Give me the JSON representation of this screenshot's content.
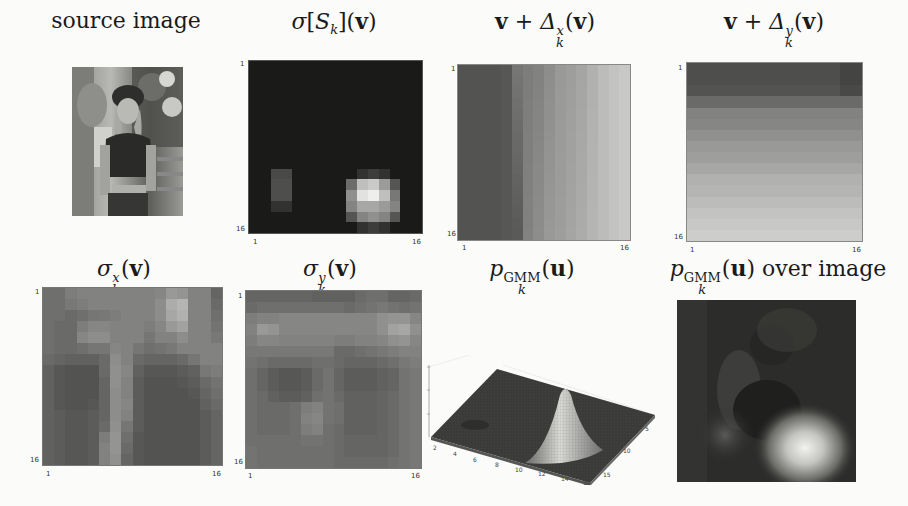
{
  "figure": {
    "panels": [
      {
        "id": "source",
        "title": "source image",
        "type": "image"
      },
      {
        "id": "sigma_S",
        "title_parts": {
          "pre": "σ[S",
          "sub": "k",
          "post": "](",
          "bold": "v",
          "end": ")"
        },
        "type": "heatmap",
        "x_ticks": [
          "1",
          "16"
        ],
        "y_ticks": [
          "1",
          "16"
        ]
      },
      {
        "id": "delta_x",
        "title_parts": {
          "bold1": "v",
          "mid": " + Δ",
          "sup": "x",
          "sub": "k",
          "open": "(",
          "bold2": "v",
          "close": ")"
        },
        "type": "heatmap",
        "x_ticks": [
          "1",
          "16"
        ],
        "y_ticks": [
          "1",
          "16"
        ]
      },
      {
        "id": "delta_y",
        "title_parts": {
          "bold1": "v",
          "mid": " + Δ",
          "sup": "y",
          "sub": "k",
          "open": "(",
          "bold2": "v",
          "close": ")"
        },
        "type": "heatmap",
        "x_ticks": [
          "1",
          "16"
        ],
        "y_ticks": [
          "1",
          "16"
        ]
      },
      {
        "id": "sigma_x",
        "title_parts": {
          "pre": "σ",
          "sup": "x",
          "sub": "k",
          "open": "(",
          "bold": "v",
          "close": ")"
        },
        "type": "heatmap",
        "x_ticks": [
          "1",
          "16"
        ],
        "y_ticks": [
          "1",
          "16"
        ]
      },
      {
        "id": "sigma_y",
        "title_parts": {
          "pre": "σ",
          "sup": "y",
          "sub": "k",
          "open": "(",
          "bold": "v",
          "close": ")"
        },
        "type": "heatmap",
        "x_ticks": [
          "1",
          "16"
        ],
        "y_ticks": [
          "1",
          "16"
        ]
      },
      {
        "id": "p_gmm",
        "title_parts": {
          "pre": "p",
          "sup": "GMM",
          "sub": "k",
          "open": "(",
          "bold": "u",
          "close": ")"
        },
        "type": "surface3d",
        "x_ticks": [
          "2",
          "4",
          "6",
          "8",
          "10",
          "12",
          "14",
          "16"
        ],
        "y_ticks": [
          "5",
          "10",
          "15"
        ]
      },
      {
        "id": "p_gmm_over",
        "title_parts": {
          "pre": "p",
          "sup": "GMM",
          "sub": "k",
          "open": "(",
          "bold": "u",
          "close": ")",
          "suffix": " over image"
        },
        "type": "image_overlay"
      }
    ]
  },
  "chart_data": [
    {
      "type": "heatmap",
      "title": "σ[S_k](v)",
      "xlabel": "",
      "ylabel": "",
      "xlim": [
        1,
        16
      ],
      "ylim": [
        1,
        16
      ],
      "x_ticks": [
        1,
        16
      ],
      "y_ticks": [
        1,
        16
      ],
      "colormap": "gray",
      "description": "Mostly near-zero (black). Bright blob centered around rows 12-15, cols 10-14; faint blob around rows 11-13, cols 3-4.",
      "values": [
        [
          0,
          0,
          0,
          0,
          0,
          0,
          0,
          0,
          0,
          0,
          0,
          0,
          0,
          0,
          0,
          0
        ],
        [
          0,
          0,
          0,
          0,
          0,
          0,
          0,
          0,
          0,
          0,
          0,
          0,
          0,
          0,
          0,
          0
        ],
        [
          0,
          0,
          0,
          0,
          0,
          0,
          0,
          0,
          0,
          0,
          0,
          0,
          0,
          0,
          0,
          0
        ],
        [
          0,
          0,
          0,
          0,
          0,
          0,
          0,
          0,
          0,
          0,
          0,
          0,
          0,
          0,
          0,
          0
        ],
        [
          0,
          0,
          0,
          0,
          0,
          0,
          0,
          0,
          0,
          0,
          0,
          0,
          0,
          0,
          0,
          0
        ],
        [
          0,
          0,
          0,
          0,
          0,
          0,
          0,
          0,
          0,
          0,
          0,
          0,
          0,
          0,
          0,
          0
        ],
        [
          0,
          0,
          0,
          0,
          0,
          0,
          0,
          0,
          0,
          0,
          0,
          0,
          0,
          0,
          0,
          0
        ],
        [
          0,
          0,
          0,
          0,
          0,
          0,
          0,
          0,
          0,
          0,
          0,
          0,
          0,
          0,
          0,
          0
        ],
        [
          0,
          0,
          0,
          0,
          0,
          0,
          0,
          0,
          0,
          0,
          0,
          0,
          0,
          0,
          0,
          0
        ],
        [
          0,
          0,
          0,
          0,
          0,
          0,
          0,
          0,
          0,
          0,
          0,
          0,
          0,
          0,
          0,
          0
        ],
        [
          0,
          0,
          0.2,
          0.2,
          0,
          0,
          0,
          0,
          0,
          0,
          0.1,
          0.15,
          0.1,
          0,
          0,
          0
        ],
        [
          0,
          0,
          0.22,
          0.22,
          0,
          0,
          0,
          0,
          0,
          0.35,
          0.7,
          0.75,
          0.55,
          0.25,
          0,
          0
        ],
        [
          0,
          0,
          0.22,
          0.22,
          0,
          0,
          0,
          0,
          0,
          0.5,
          0.85,
          0.9,
          0.7,
          0.4,
          0,
          0
        ],
        [
          0,
          0,
          0.1,
          0.1,
          0,
          0,
          0,
          0,
          0,
          0.45,
          0.6,
          0.6,
          0.55,
          0.45,
          0,
          0
        ],
        [
          0,
          0,
          0,
          0,
          0,
          0,
          0,
          0,
          0,
          0.25,
          0.45,
          0.5,
          0.45,
          0.25,
          0,
          0
        ],
        [
          0,
          0,
          0,
          0,
          0,
          0,
          0,
          0,
          0,
          0,
          0.1,
          0.15,
          0.1,
          0,
          0,
          0
        ]
      ]
    },
    {
      "type": "heatmap",
      "title": "v + Δ^x_k(v)",
      "xlim": [
        1,
        16
      ],
      "ylim": [
        1,
        16
      ],
      "x_ticks": [
        1,
        16
      ],
      "y_ticks": [
        1,
        16
      ],
      "colormap": "gray",
      "description": "Horizontal gradient: dark on left columns (1-4), increasing brightness to the right (cols 13-16 brightest); columns 5-7 step brighter in lower rows.",
      "column_profile_top": [
        0.3,
        0.3,
        0.3,
        0.3,
        0.32,
        0.45,
        0.48,
        0.5,
        0.55,
        0.6,
        0.62,
        0.65,
        0.7,
        0.75,
        0.78,
        0.8
      ],
      "column_profile_bottom": [
        0.3,
        0.3,
        0.3,
        0.3,
        0.32,
        0.33,
        0.5,
        0.55,
        0.6,
        0.62,
        0.65,
        0.68,
        0.72,
        0.75,
        0.78,
        0.8
      ]
    },
    {
      "type": "heatmap",
      "title": "v + Δ^y_k(v)",
      "xlim": [
        1,
        16
      ],
      "ylim": [
        1,
        16
      ],
      "x_ticks": [
        1,
        16
      ],
      "y_ticks": [
        1,
        16
      ],
      "colormap": "gray",
      "description": "Vertical gradient: darkest top rows (1-3), increasing brightness toward bottom rows.",
      "row_profile": [
        0.28,
        0.28,
        0.3,
        0.4,
        0.5,
        0.52,
        0.56,
        0.6,
        0.62,
        0.66,
        0.7,
        0.72,
        0.75,
        0.78,
        0.8,
        0.82
      ]
    },
    {
      "type": "heatmap",
      "title": "σ^x_k(v)",
      "xlim": [
        1,
        16
      ],
      "ylim": [
        1,
        16
      ],
      "x_ticks": [
        1,
        16
      ],
      "y_ticks": [
        1,
        16
      ],
      "colormap": "gray",
      "description": "Mid-gray field; brighter patch around rows 2-5, cols 12-13; bright vertical stripe near col 7-8 in lower half; dark blocks lower-left and lower-right.",
      "values": [
        [
          0.42,
          0.42,
          0.48,
          0.5,
          0.5,
          0.5,
          0.5,
          0.5,
          0.5,
          0.5,
          0.52,
          0.6,
          0.58,
          0.5,
          0.5,
          0.38
        ],
        [
          0.42,
          0.42,
          0.46,
          0.48,
          0.5,
          0.5,
          0.5,
          0.5,
          0.5,
          0.5,
          0.55,
          0.68,
          0.72,
          0.5,
          0.5,
          0.4
        ],
        [
          0.42,
          0.42,
          0.4,
          0.42,
          0.45,
          0.46,
          0.48,
          0.5,
          0.5,
          0.5,
          0.55,
          0.66,
          0.7,
          0.5,
          0.5,
          0.42
        ],
        [
          0.42,
          0.4,
          0.4,
          0.48,
          0.52,
          0.52,
          0.5,
          0.5,
          0.5,
          0.48,
          0.52,
          0.6,
          0.64,
          0.5,
          0.5,
          0.44
        ],
        [
          0.42,
          0.4,
          0.4,
          0.52,
          0.55,
          0.55,
          0.5,
          0.5,
          0.5,
          0.45,
          0.5,
          0.5,
          0.55,
          0.5,
          0.5,
          0.46
        ],
        [
          0.42,
          0.4,
          0.4,
          0.42,
          0.45,
          0.45,
          0.52,
          0.5,
          0.45,
          0.42,
          0.44,
          0.46,
          0.5,
          0.5,
          0.5,
          0.5
        ],
        [
          0.4,
          0.38,
          0.36,
          0.36,
          0.36,
          0.4,
          0.55,
          0.5,
          0.4,
          0.38,
          0.38,
          0.38,
          0.4,
          0.45,
          0.5,
          0.5
        ],
        [
          0.36,
          0.32,
          0.3,
          0.3,
          0.3,
          0.4,
          0.56,
          0.52,
          0.36,
          0.32,
          0.32,
          0.32,
          0.34,
          0.36,
          0.46,
          0.48
        ],
        [
          0.36,
          0.32,
          0.3,
          0.3,
          0.3,
          0.38,
          0.56,
          0.5,
          0.34,
          0.3,
          0.3,
          0.3,
          0.32,
          0.34,
          0.4,
          0.44
        ],
        [
          0.36,
          0.32,
          0.3,
          0.3,
          0.3,
          0.38,
          0.55,
          0.5,
          0.34,
          0.3,
          0.3,
          0.3,
          0.3,
          0.32,
          0.38,
          0.42
        ],
        [
          0.36,
          0.32,
          0.3,
          0.3,
          0.32,
          0.38,
          0.55,
          0.52,
          0.34,
          0.3,
          0.3,
          0.3,
          0.3,
          0.3,
          0.36,
          0.4
        ],
        [
          0.36,
          0.34,
          0.32,
          0.32,
          0.34,
          0.38,
          0.55,
          0.5,
          0.34,
          0.3,
          0.3,
          0.3,
          0.3,
          0.3,
          0.34,
          0.38
        ],
        [
          0.36,
          0.34,
          0.32,
          0.32,
          0.34,
          0.4,
          0.56,
          0.45,
          0.34,
          0.3,
          0.3,
          0.3,
          0.3,
          0.3,
          0.34,
          0.38
        ],
        [
          0.36,
          0.34,
          0.32,
          0.32,
          0.34,
          0.48,
          0.58,
          0.42,
          0.32,
          0.3,
          0.3,
          0.3,
          0.3,
          0.3,
          0.34,
          0.38
        ],
        [
          0.36,
          0.34,
          0.32,
          0.32,
          0.34,
          0.5,
          0.58,
          0.4,
          0.32,
          0.3,
          0.3,
          0.3,
          0.3,
          0.3,
          0.34,
          0.38
        ],
        [
          0.36,
          0.34,
          0.32,
          0.32,
          0.34,
          0.5,
          0.56,
          0.38,
          0.32,
          0.3,
          0.3,
          0.3,
          0.3,
          0.3,
          0.34,
          0.38
        ]
      ]
    },
    {
      "type": "heatmap",
      "title": "σ^y_k(v)",
      "xlim": [
        1,
        16
      ],
      "ylim": [
        1,
        16
      ],
      "x_ticks": [
        1,
        16
      ],
      "y_ticks": [
        1,
        16
      ],
      "colormap": "gray",
      "description": "Dark top band rows 1-2; brighter band rows 3-5 with bright spots at left (col 2) and right (col 15); darker lower half with a lighter patch near cols 6-7 rows 11-13.",
      "values": [
        [
          0.38,
          0.38,
          0.38,
          0.38,
          0.38,
          0.38,
          0.36,
          0.36,
          0.36,
          0.36,
          0.4,
          0.42,
          0.42,
          0.38,
          0.38,
          0.4
        ],
        [
          0.4,
          0.42,
          0.42,
          0.42,
          0.42,
          0.42,
          0.42,
          0.42,
          0.42,
          0.4,
          0.42,
          0.44,
          0.46,
          0.44,
          0.42,
          0.44
        ],
        [
          0.48,
          0.5,
          0.5,
          0.52,
          0.52,
          0.52,
          0.52,
          0.52,
          0.52,
          0.52,
          0.52,
          0.52,
          0.56,
          0.58,
          0.58,
          0.52
        ],
        [
          0.5,
          0.6,
          0.58,
          0.52,
          0.52,
          0.52,
          0.52,
          0.52,
          0.52,
          0.52,
          0.52,
          0.52,
          0.56,
          0.64,
          0.66,
          0.56
        ],
        [
          0.48,
          0.52,
          0.52,
          0.5,
          0.5,
          0.5,
          0.5,
          0.5,
          0.48,
          0.48,
          0.5,
          0.5,
          0.52,
          0.56,
          0.58,
          0.52
        ],
        [
          0.46,
          0.46,
          0.46,
          0.46,
          0.46,
          0.46,
          0.46,
          0.46,
          0.4,
          0.4,
          0.42,
          0.44,
          0.46,
          0.48,
          0.5,
          0.5
        ],
        [
          0.44,
          0.42,
          0.4,
          0.4,
          0.4,
          0.4,
          0.42,
          0.42,
          0.4,
          0.38,
          0.38,
          0.38,
          0.4,
          0.42,
          0.46,
          0.48
        ],
        [
          0.42,
          0.38,
          0.34,
          0.32,
          0.32,
          0.34,
          0.4,
          0.44,
          0.38,
          0.34,
          0.34,
          0.34,
          0.36,
          0.38,
          0.44,
          0.46
        ],
        [
          0.42,
          0.38,
          0.34,
          0.32,
          0.32,
          0.34,
          0.4,
          0.44,
          0.38,
          0.34,
          0.34,
          0.34,
          0.36,
          0.38,
          0.44,
          0.46
        ],
        [
          0.42,
          0.4,
          0.36,
          0.34,
          0.34,
          0.36,
          0.42,
          0.44,
          0.4,
          0.36,
          0.36,
          0.36,
          0.38,
          0.4,
          0.44,
          0.46
        ],
        [
          0.42,
          0.4,
          0.4,
          0.4,
          0.42,
          0.48,
          0.5,
          0.44,
          0.42,
          0.36,
          0.36,
          0.36,
          0.38,
          0.4,
          0.44,
          0.46
        ],
        [
          0.42,
          0.4,
          0.4,
          0.4,
          0.42,
          0.5,
          0.52,
          0.44,
          0.42,
          0.36,
          0.36,
          0.36,
          0.38,
          0.4,
          0.44,
          0.46
        ],
        [
          0.42,
          0.4,
          0.4,
          0.4,
          0.42,
          0.48,
          0.5,
          0.42,
          0.4,
          0.36,
          0.36,
          0.36,
          0.38,
          0.4,
          0.44,
          0.46
        ],
        [
          0.42,
          0.42,
          0.42,
          0.42,
          0.42,
          0.44,
          0.44,
          0.42,
          0.4,
          0.38,
          0.38,
          0.38,
          0.38,
          0.4,
          0.44,
          0.46
        ],
        [
          0.44,
          0.42,
          0.42,
          0.42,
          0.42,
          0.42,
          0.42,
          0.42,
          0.4,
          0.38,
          0.38,
          0.38,
          0.38,
          0.4,
          0.44,
          0.46
        ],
        [
          0.44,
          0.42,
          0.42,
          0.42,
          0.42,
          0.42,
          0.42,
          0.42,
          0.4,
          0.4,
          0.4,
          0.4,
          0.4,
          0.42,
          0.44,
          0.46
        ]
      ]
    },
    {
      "type": "surface3d",
      "title": "p^GMM_k(u)",
      "x_ticks": [
        2,
        4,
        6,
        8,
        10,
        12,
        14,
        16
      ],
      "y_ticks": [
        5,
        10,
        15
      ],
      "xlim": [
        1,
        16
      ],
      "ylim": [
        1,
        16
      ],
      "description": "Flat dark surface with one sharp Gaussian peak near x≈12, y≈13 and a small bump near x≈4, y≈12.",
      "peaks": [
        {
          "x": 12,
          "y": 13,
          "height": 1.0
        },
        {
          "x": 4,
          "y": 12,
          "height": 0.08
        }
      ]
    }
  ]
}
